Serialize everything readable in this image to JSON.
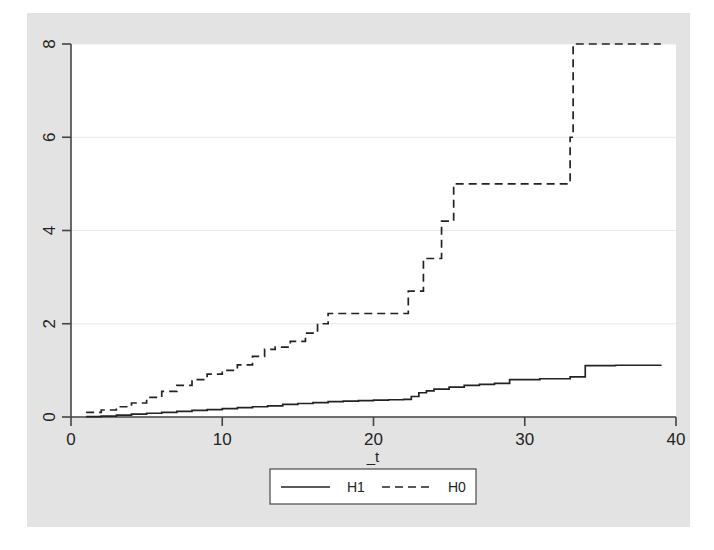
{
  "figure": {
    "background_color": "#ffffff",
    "graph_region_color": "#e3e3e3",
    "plot_region_color": "#ffffff",
    "axis_color": "#444444",
    "grid_color": "#e8e8e8"
  },
  "chart_data": {
    "type": "line",
    "subtype": "step",
    "title": "",
    "subtitle": "",
    "xlabel": "_t",
    "ylabel": "",
    "xlim": [
      0,
      40
    ],
    "ylim": [
      0,
      8
    ],
    "xticks": [
      0,
      10,
      20,
      30,
      40
    ],
    "yticks": [
      0,
      2,
      4,
      6,
      8
    ],
    "xticklabels": [
      "0",
      "10",
      "20",
      "30",
      "40"
    ],
    "yticklabels": [
      "0",
      "2",
      "4",
      "6",
      "8"
    ],
    "grid": "horizontal",
    "grid_color": "#e8e8e8",
    "legend_position": "bottom",
    "legend_entries": [
      {
        "label": "H1",
        "style": "solid",
        "color": "#232323"
      },
      {
        "label": "H0",
        "style": "dashed",
        "color": "#232323"
      }
    ],
    "series": [
      {
        "name": "H1",
        "style": "solid",
        "color": "#232323",
        "x": [
          1.0,
          2.0,
          3.0,
          4.0,
          5.0,
          6.0,
          7.0,
          8.0,
          9.0,
          10.0,
          11.0,
          12.0,
          13.0,
          14.0,
          15.0,
          16.0,
          17.0,
          18.0,
          19.0,
          20.0,
          21.0,
          22.0,
          22.5,
          23.0,
          23.5,
          24.0,
          25.0,
          26.0,
          27.0,
          28.0,
          29.0,
          31.0,
          33.0,
          34.0,
          36.0,
          39.0
        ],
        "y": [
          0.01,
          0.02,
          0.04,
          0.06,
          0.08,
          0.1,
          0.12,
          0.14,
          0.16,
          0.18,
          0.2,
          0.22,
          0.24,
          0.27,
          0.29,
          0.31,
          0.33,
          0.34,
          0.35,
          0.36,
          0.37,
          0.38,
          0.44,
          0.52,
          0.56,
          0.6,
          0.64,
          0.68,
          0.7,
          0.72,
          0.8,
          0.82,
          0.86,
          1.1,
          1.11,
          1.12
        ]
      },
      {
        "name": "H0",
        "style": "dashed",
        "color": "#232323",
        "x": [
          1.0,
          2.0,
          3.0,
          4.0,
          5.0,
          6.0,
          7.0,
          8.0,
          9.0,
          10.0,
          11.0,
          12.0,
          12.8,
          13.5,
          14.5,
          15.5,
          16.3,
          17.0,
          22.0,
          22.3,
          23.0,
          23.3,
          24.0,
          24.5,
          25.0,
          25.3,
          28.0,
          33.0,
          33.2,
          39.0
        ],
        "y": [
          0.1,
          0.15,
          0.22,
          0.3,
          0.42,
          0.55,
          0.68,
          0.8,
          0.92,
          1.0,
          1.12,
          1.3,
          1.45,
          1.5,
          1.62,
          1.8,
          2.0,
          2.22,
          2.22,
          2.7,
          2.7,
          3.4,
          3.4,
          4.2,
          4.2,
          5.0,
          5.0,
          6.0,
          8.0,
          8.0
        ]
      }
    ]
  },
  "axis": {
    "x_title": "_t"
  },
  "legend": {
    "items": [
      {
        "label": "H1",
        "style": "solid"
      },
      {
        "label": "H0",
        "style": "dashed"
      }
    ]
  }
}
